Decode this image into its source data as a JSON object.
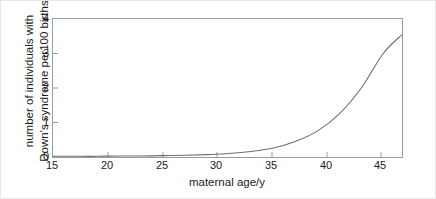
{
  "chart_data": {
    "type": "line",
    "title": "",
    "xlabel": "maternal age/y",
    "ylabel_line1": "number of individuals with",
    "ylabel_line2": "Down's syndrome per100 births",
    "xlim": [
      15,
      46.7
    ],
    "ylim": [
      0,
      4
    ],
    "xticks": [
      15,
      20,
      25,
      30,
      35,
      40,
      45
    ],
    "yticks": [
      0,
      1,
      2,
      3,
      4
    ],
    "grid": false,
    "legend": null,
    "line_color": "#6e6e6e",
    "frame_color": "#9b9b9b",
    "series": [
      {
        "name": "Down's syndrome incidence",
        "x": [
          15,
          17,
          19,
          21,
          23,
          25,
          27,
          29,
          31,
          33,
          35,
          37,
          39,
          41,
          43,
          45,
          46.7
        ],
        "values": [
          0.02,
          0.02,
          0.02,
          0.03,
          0.03,
          0.04,
          0.05,
          0.07,
          0.1,
          0.16,
          0.26,
          0.45,
          0.75,
          1.25,
          2.0,
          3.0,
          3.55
        ]
      }
    ]
  },
  "axes": {
    "xtick_labels": [
      "15",
      "20",
      "25",
      "30",
      "35",
      "40",
      "45"
    ],
    "ytick_labels": [
      "0",
      "1",
      "2",
      "3",
      "4"
    ]
  }
}
